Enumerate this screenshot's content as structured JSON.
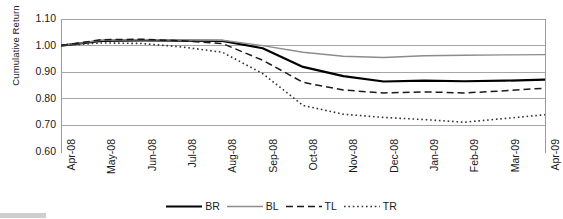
{
  "chart_data": {
    "type": "line",
    "title": "",
    "xlabel": "",
    "ylabel": "Cumulative Return",
    "ylim": [
      0.6,
      1.1
    ],
    "yticks": [
      "1.10",
      "1.00",
      "0.90",
      "0.80",
      "0.70",
      "0.60"
    ],
    "ytick_values": [
      1.1,
      1.0,
      0.9,
      0.8,
      0.7,
      0.6
    ],
    "grid": true,
    "legend_position": "bottom",
    "categories": [
      "Apr-08",
      "May-08",
      "Jun-08",
      "Jul-08",
      "Aug-08",
      "Sep-08",
      "Oct-08",
      "Nov-08",
      "Dec-08",
      "Jan-09",
      "Feb-09",
      "Mar-09",
      "Apr-09"
    ],
    "series": [
      {
        "name": "BR",
        "style": "solid-black-thick",
        "color": "#000000",
        "values": [
          1.0,
          1.018,
          1.02,
          1.019,
          1.018,
          0.99,
          0.92,
          0.885,
          0.865,
          0.868,
          0.866,
          0.868,
          0.872
        ]
      },
      {
        "name": "BL",
        "style": "solid-gray",
        "color": "#8c8c8c",
        "values": [
          1.0,
          1.02,
          1.022,
          1.021,
          1.02,
          1.0,
          0.975,
          0.96,
          0.955,
          0.962,
          0.964,
          0.965,
          0.966
        ]
      },
      {
        "name": "TL",
        "style": "dashed-black",
        "color": "#1a1a1a",
        "values": [
          1.0,
          1.022,
          1.024,
          1.018,
          1.008,
          0.945,
          0.862,
          0.833,
          0.822,
          0.826,
          0.822,
          0.83,
          0.84
        ]
      },
      {
        "name": "TR",
        "style": "dotted-black",
        "color": "#333333",
        "values": [
          1.0,
          1.01,
          1.008,
          0.995,
          0.975,
          0.895,
          0.775,
          0.742,
          0.73,
          0.722,
          0.712,
          0.726,
          0.74
        ]
      }
    ]
  },
  "legend": {
    "items": [
      {
        "label": "BR"
      },
      {
        "label": "BL"
      },
      {
        "label": "TL"
      },
      {
        "label": "TR"
      }
    ]
  }
}
